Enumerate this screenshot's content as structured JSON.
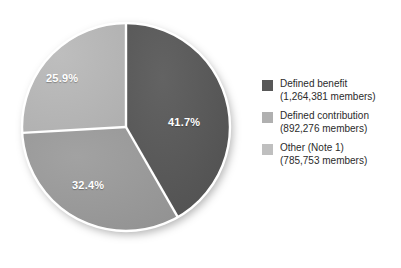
{
  "chart_data": {
    "type": "pie",
    "title": "",
    "subtitle": "",
    "xlabel": "",
    "ylabel": "",
    "grid": false,
    "legend_position": "right",
    "start_angle_deg": 0,
    "direction": "clockwise",
    "categories": [
      "Defined benefit",
      "Defined contribution",
      "Other (Note 1)"
    ],
    "values": [
      41.7,
      32.4,
      25.9
    ],
    "value_unit": "percent",
    "counts": [
      1264381,
      892276,
      785753
    ],
    "slices": [
      {
        "name": "Defined benefit",
        "percent_label": "41.7%",
        "percent": 41.7,
        "members_label": "(1,264,381 members)",
        "members": 1264381,
        "color": "#585858"
      },
      {
        "name": "Defined contribution",
        "percent_label": "32.4%",
        "percent": 32.4,
        "members_label": "(892,276 members)",
        "members": 892276,
        "color": "#9a9a9a"
      },
      {
        "name": "Other (Note 1)",
        "percent_label": "25.9%",
        "percent": 25.9,
        "members_label": "(785,753 members)",
        "members": 785753,
        "color": "#b7b7b7"
      }
    ]
  },
  "pie": {
    "center_x": 126,
    "center_y": 127,
    "radius": 104,
    "divider_color": "#ffffff",
    "divider_width": 2.4,
    "label_color": "#ffffff"
  },
  "legend": {
    "items": [
      {
        "label": "Defined benefit",
        "sublabel": "(1,264,381 members)",
        "color": "#585858"
      },
      {
        "label": "Defined contribution",
        "sublabel": "(892,276 members)",
        "color": "#b0b0b0"
      },
      {
        "label": "Other (Note 1)",
        "sublabel": "(785,753 members)",
        "color": "#bfbfbf"
      }
    ]
  }
}
